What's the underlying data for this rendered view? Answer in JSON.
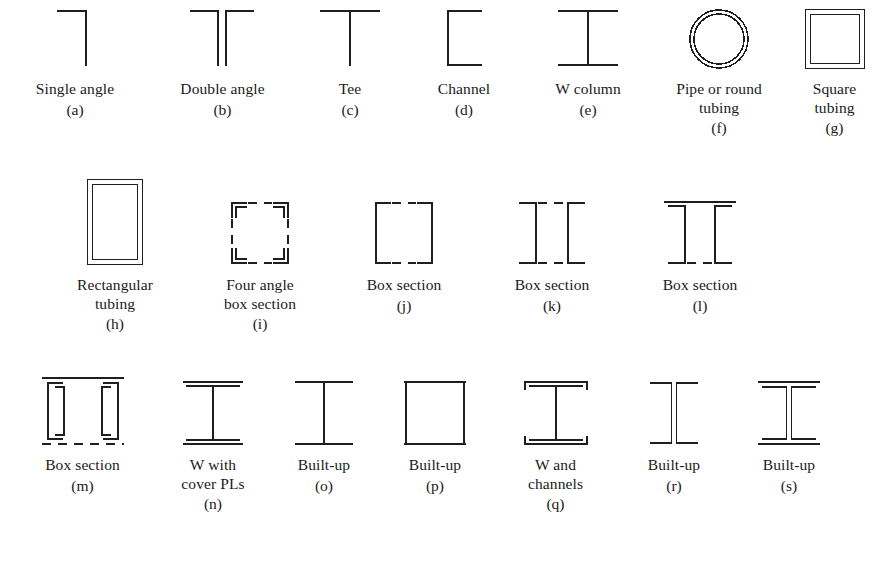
{
  "figure": {
    "line_color": "#1f1f1f",
    "background": "#ffffff",
    "rows": [
      {
        "row_index": 1,
        "items": [
          {
            "key": "a",
            "label": "Single angle",
            "sublabel": "(a)",
            "shape": "single-angle",
            "width": 150
          },
          {
            "key": "b",
            "label": "Double angle",
            "sublabel": "(b)",
            "shape": "double-angle",
            "width": 145
          },
          {
            "key": "c",
            "label": "Tee",
            "sublabel": "(c)",
            "shape": "tee",
            "width": 110
          },
          {
            "key": "d",
            "label": "Channel",
            "sublabel": "(d)",
            "shape": "channel",
            "width": 118
          },
          {
            "key": "e",
            "label": "W column",
            "sublabel": "(e)",
            "shape": "w-column",
            "width": 130
          },
          {
            "key": "f",
            "label": "Pipe or round\ntubing",
            "sublabel": "(f)",
            "shape": "pipe-round-tubing",
            "width": 132
          },
          {
            "key": "g",
            "label": "Square\ntubing",
            "sublabel": "(g)",
            "shape": "square-tubing",
            "width": 99
          }
        ]
      },
      {
        "row_index": 2,
        "items": [
          {
            "key": "h",
            "label": "Rectangular\ntubing",
            "sublabel": "(h)",
            "shape": "rectangular-tubing",
            "width": 150,
            "offset": 40
          },
          {
            "key": "i",
            "label": "Four angle\nbox section",
            "sublabel": "(i)",
            "shape": "four-angle-box",
            "width": 140
          },
          {
            "key": "j",
            "label": "Box section",
            "sublabel": "(j)",
            "shape": "box-section-j",
            "width": 148
          },
          {
            "key": "k",
            "label": "Box section",
            "sublabel": "(k)",
            "shape": "box-section-k",
            "width": 148
          },
          {
            "key": "l",
            "label": "Box section",
            "sublabel": "(l)",
            "shape": "box-section-l",
            "width": 148
          }
        ]
      },
      {
        "row_index": 3,
        "items": [
          {
            "key": "m",
            "label": "Box section",
            "sublabel": "(m)",
            "shape": "box-section-m",
            "width": 145,
            "offset": 10
          },
          {
            "key": "n",
            "label": "W with\ncover PLs",
            "sublabel": "(n)",
            "shape": "w-cover-plates",
            "width": 116
          },
          {
            "key": "o",
            "label": "Built-up",
            "sublabel": "(o)",
            "shape": "built-up-i",
            "width": 106
          },
          {
            "key": "p",
            "label": "Built-up",
            "sublabel": "(p)",
            "shape": "built-up-box",
            "width": 116
          },
          {
            "key": "q",
            "label": "W and\nchannels",
            "sublabel": "(q)",
            "shape": "w-and-channels",
            "width": 125
          },
          {
            "key": "r",
            "label": "Built-up",
            "sublabel": "(r)",
            "shape": "built-up-four-angle",
            "width": 112
          },
          {
            "key": "s",
            "label": "Built-up",
            "sublabel": "(s)",
            "shape": "built-up-four-angle-plates",
            "width": 118
          }
        ]
      }
    ]
  }
}
